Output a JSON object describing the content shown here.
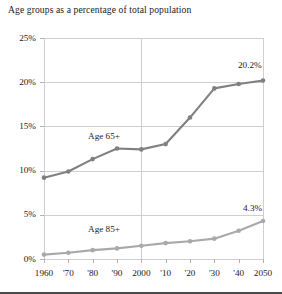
{
  "chart_data": {
    "type": "line",
    "title": "Age groups as a percentage of total population",
    "xlabel": "",
    "ylabel": "",
    "x": [
      1960,
      1970,
      1980,
      1990,
      2000,
      2010,
      2020,
      2030,
      2040,
      2050
    ],
    "xtick_labels": [
      "1960",
      "'70",
      "'80",
      "'90",
      "2000",
      "'10",
      "'20",
      "'30",
      "'40",
      "2050"
    ],
    "ytick_labels": [
      "0%",
      "5%",
      "10%",
      "15%",
      "20%",
      "25%"
    ],
    "ytick_values": [
      0,
      5,
      10,
      15,
      20,
      25
    ],
    "ylim": [
      0,
      25
    ],
    "xlim": [
      1960,
      2050
    ],
    "grid": true,
    "legend_position": "inline-annotation",
    "series": [
      {
        "name": "Age 65+",
        "color": "#808080",
        "label_text": "Age 65+",
        "end_label": "20.2%",
        "values": [
          9.2,
          9.9,
          11.3,
          12.5,
          12.4,
          13.0,
          16.0,
          19.3,
          19.8,
          20.2
        ]
      },
      {
        "name": "Age 85+",
        "color": "#a9a9a9",
        "label_text": "Age 85+",
        "end_label": "4.3%",
        "values": [
          0.5,
          0.7,
          1.0,
          1.2,
          1.5,
          1.8,
          2.0,
          2.3,
          3.2,
          4.3
        ]
      }
    ]
  },
  "colors": {
    "series_65_plus": "#808080",
    "series_85_plus": "#a9a9a9",
    "gridline": "#cfcfcf",
    "border": "#4a4a4a",
    "text": "#1a1a1a",
    "background": "#ffffff"
  }
}
